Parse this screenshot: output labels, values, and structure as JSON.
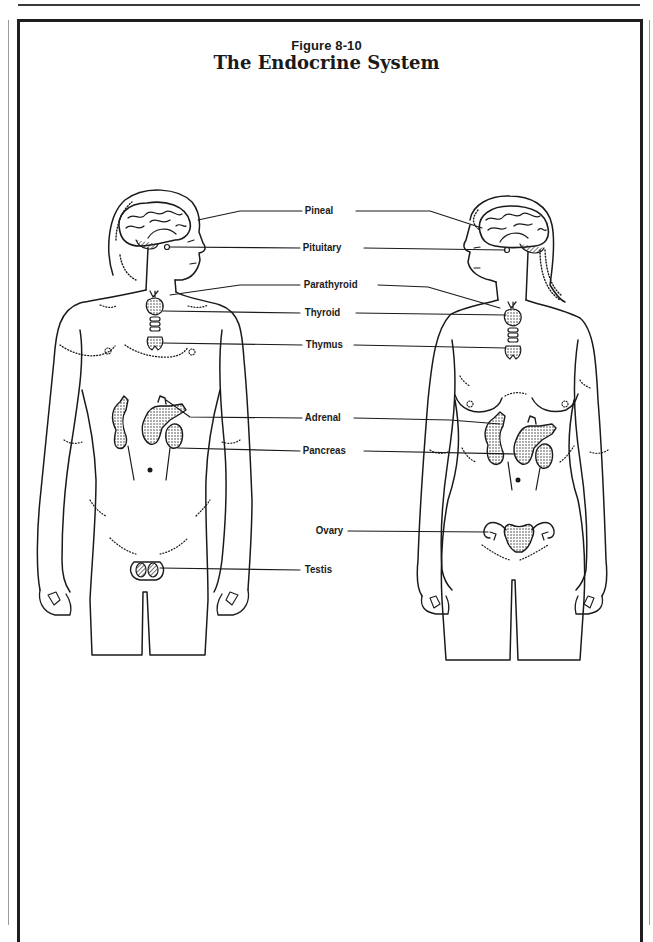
{
  "figure": {
    "number": "Figure 8-10",
    "title": "The Endocrine System"
  },
  "labels": {
    "pineal": "Pineal",
    "pituitary": "Pituitary",
    "parathyroid": "Parathyroid",
    "thyroid": "Thyroid",
    "thymus": "Thymus",
    "adrenal": "Adrenal",
    "pancreas": "Pancreas",
    "ovary": "Ovary",
    "testis": "Testis"
  },
  "figures": {
    "left": "male body outline",
    "right": "female body outline"
  },
  "colors": {
    "ink": "#1a1a1a",
    "paper": "#ffffff",
    "frame": "#1e1e1e"
  }
}
